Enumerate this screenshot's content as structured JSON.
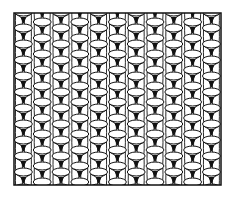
{
  "illustration": {
    "subject": "knit stitch texture pattern",
    "frame": {
      "x": 14,
      "y": 13,
      "width": 207,
      "height": 172,
      "stroke": "#111111",
      "fill": "#ffffff"
    },
    "grid": {
      "columns": 11,
      "col_width": 18.8,
      "row_height": 16,
      "rows": 12
    },
    "colors": {
      "ink": "#111111",
      "paper": "#ffffff"
    }
  }
}
